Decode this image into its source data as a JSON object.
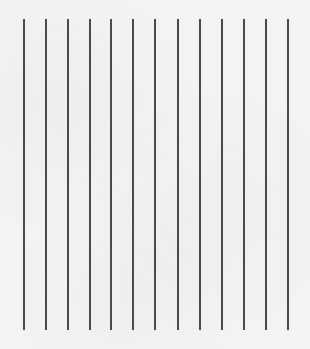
{
  "canvas": {
    "width": 310,
    "height": 349,
    "background_color": "#f3f3f2"
  },
  "lines": {
    "color": "#4a4a4a",
    "orientation": "vertical",
    "count": 13,
    "top": 19,
    "bottom": 330,
    "x_positions": [
      23,
      45,
      67,
      89,
      110,
      132,
      154,
      177,
      199,
      221,
      243,
      265,
      287
    ]
  }
}
